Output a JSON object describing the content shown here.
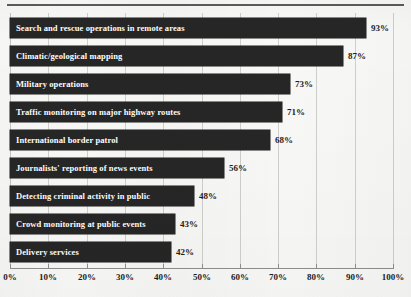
{
  "chart_data": {
    "type": "bar",
    "orientation": "horizontal",
    "title": "",
    "subtitle": "",
    "xlabel": "",
    "ylabel": "",
    "xlim": [
      0,
      100
    ],
    "grid": true,
    "legend": false,
    "value_suffix": "%",
    "categories": [
      "Search and rescue operations in remote areas",
      "Climatic/geological mapping",
      "Military operations",
      "Traffic monitoring on major highway routes",
      "International border patrol",
      "Journalists' reporting of news events",
      "Detecting criminal activity in public",
      "Crowd monitoring at public events",
      "Delivery services"
    ],
    "values": [
      93,
      87,
      73,
      71,
      68,
      56,
      48,
      43,
      42
    ],
    "value_labels": [
      "93%",
      "87%",
      "73%",
      "71%",
      "68%",
      "56%",
      "48%",
      "43%",
      "42%"
    ],
    "xticks": [
      0,
      10,
      20,
      30,
      40,
      50,
      60,
      70,
      80,
      90,
      100
    ],
    "xtick_labels": [
      "0%",
      "10%",
      "20%",
      "30%",
      "40%",
      "50%",
      "60%",
      "70%",
      "80%",
      "90%",
      "100%"
    ],
    "colors": {
      "bar_fill": "#262626",
      "bar_label_text": "#ffffff",
      "value_text": "#1d1d1d",
      "gridline": "#cfcfcb",
      "axis_line": "#8e8e8a",
      "background": "#f8f8f6",
      "top_rule": "#5b5b5b"
    }
  }
}
